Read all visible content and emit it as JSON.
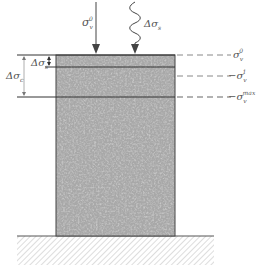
{
  "diagram": {
    "labels": {
      "sigma_v0_top": {
        "base": "σ",
        "sub": "v",
        "sup": "0"
      },
      "delta_sigma_s_top": {
        "base": "Δσ",
        "sub": "s"
      },
      "delta_sigma_s_left": {
        "base": "Δσ",
        "sub": "s"
      },
      "delta_sigma_c_left": {
        "base": "Δσ",
        "sub": "c"
      },
      "right_sigma_v0": {
        "prefix": "",
        "base": "σ",
        "sub": "v",
        "sup": "0"
      },
      "right_sigma_v1": {
        "prefix": "−",
        "base": "σ",
        "sub": "v",
        "sup": "1"
      },
      "right_sigma_vmax": {
        "prefix": "−",
        "base": "σ",
        "sub": "v",
        "sup": "max"
      }
    },
    "colors": {
      "line": "#333333",
      "dash": "#777777",
      "text": "#555555",
      "column_base": "#9a9a9a",
      "hatch": "#bbbbbb"
    }
  }
}
